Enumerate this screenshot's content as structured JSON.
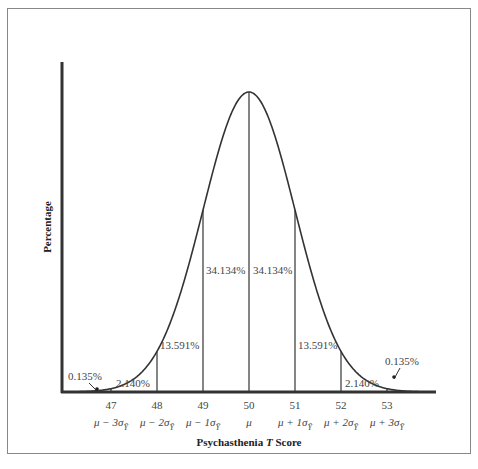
{
  "chart_data": {
    "type": "area",
    "title": "",
    "xlabel": "Psychasthenia T Score",
    "xlabel_parts": {
      "prefix": "Psychasthenia ",
      "italic": "T",
      "suffix": " Score"
    },
    "ylabel": "Percentage",
    "x_ticks": [
      47,
      48,
      49,
      50,
      51,
      52,
      53
    ],
    "x_tick_labels": [
      "47",
      "48",
      "49",
      "50",
      "51",
      "52",
      "53"
    ],
    "x_sigma_labels": [
      {
        "base": "μ − 3σ",
        "sub": "Ȳ"
      },
      {
        "base": "μ − 2σ",
        "sub": "Ȳ"
      },
      {
        "base": "μ − 1σ",
        "sub": "Ȳ"
      },
      {
        "base": "μ",
        "sub": ""
      },
      {
        "base": "μ + 1σ",
        "sub": "Ȳ"
      },
      {
        "base": "μ + 2σ",
        "sub": "Ȳ"
      },
      {
        "base": "μ + 3σ",
        "sub": "Ȳ"
      }
    ],
    "mean": 50,
    "sd": 1,
    "regions": [
      {
        "range": "< 47",
        "percent": 0.135,
        "label": "0.135%"
      },
      {
        "range": "47-48",
        "percent": 2.14,
        "label": "2.140%"
      },
      {
        "range": "48-49",
        "percent": 13.591,
        "label": "13.591%"
      },
      {
        "range": "49-50",
        "percent": 34.134,
        "label": "34.134%"
      },
      {
        "range": "50-51",
        "percent": 34.134,
        "label": "34.134%"
      },
      {
        "range": "51-52",
        "percent": 13.591,
        "label": "13.591%"
      },
      {
        "range": "52-53",
        "percent": 2.14,
        "label": "2.140%"
      },
      {
        "range": "> 53",
        "percent": 0.135,
        "label": "0.135%"
      }
    ],
    "grid": false,
    "legend": null
  }
}
